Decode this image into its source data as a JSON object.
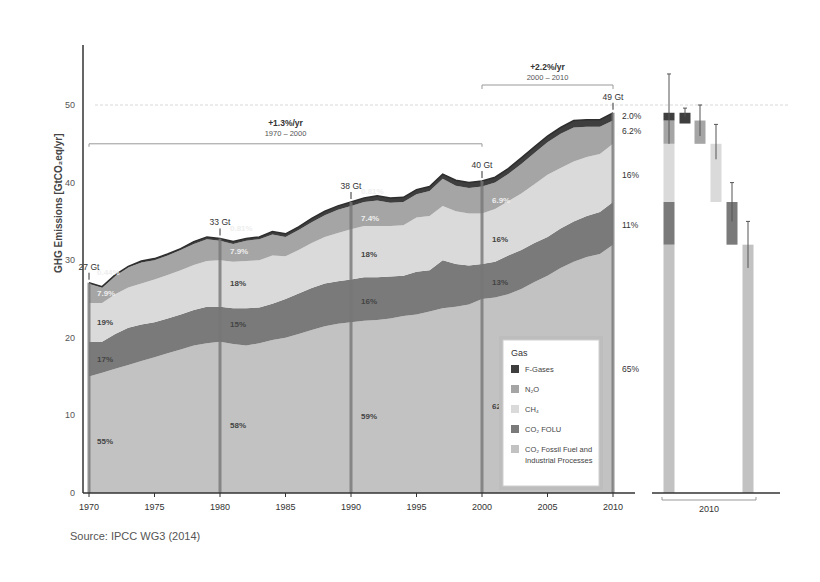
{
  "chart_data": {
    "type": "area",
    "title": "",
    "ylabel": "GHG Emissions [GtCO2eq/yr]",
    "xlabel": "",
    "ylim": [
      0,
      50
    ],
    "yticks": [
      0,
      10,
      20,
      30,
      40,
      50
    ],
    "xticks": [
      1970,
      1975,
      1980,
      1985,
      1990,
      1995,
      2000,
      2005,
      2010
    ],
    "x": [
      1970,
      1971,
      1972,
      1973,
      1974,
      1975,
      1976,
      1977,
      1978,
      1979,
      1980,
      1981,
      1982,
      1983,
      1984,
      1985,
      1986,
      1987,
      1988,
      1989,
      1990,
      1991,
      1992,
      1993,
      1994,
      1995,
      1996,
      1997,
      1998,
      1999,
      2000,
      2001,
      2002,
      2003,
      2004,
      2005,
      2006,
      2007,
      2008,
      2009,
      2010
    ],
    "series": [
      {
        "name": "CO2 Fossil Fuel and Industrial Processes",
        "color": "#c2c2c2",
        "values": [
          15,
          15.5,
          16,
          16.5,
          17,
          17.5,
          18,
          18.5,
          19,
          19.3,
          19.5,
          19.2,
          19,
          19.3,
          19.7,
          20,
          20.5,
          21,
          21.5,
          21.8,
          22,
          22.2,
          22.3,
          22.5,
          22.8,
          23,
          23.4,
          23.8,
          24,
          24.3,
          25,
          25.2,
          25.6,
          26.3,
          27.2,
          28,
          29,
          29.8,
          30.4,
          30.8,
          32
        ]
      },
      {
        "name": "CO2 FOLU",
        "color": "#7a7a7a",
        "values": [
          4.5,
          4,
          4.5,
          4.8,
          4.7,
          4.5,
          4.5,
          4.5,
          4.6,
          4.7,
          4.5,
          4.6,
          4.8,
          4.6,
          4.7,
          5,
          5.2,
          5.4,
          5.5,
          5.5,
          5.5,
          5.6,
          5.5,
          5.4,
          5.2,
          5.5,
          5.3,
          6.2,
          5.5,
          5,
          4.5,
          4.6,
          5,
          5,
          5,
          5,
          5.1,
          5.2,
          5.3,
          5.4,
          5.5
        ]
      },
      {
        "name": "CH4",
        "color": "#dadada",
        "values": [
          5,
          5,
          5.1,
          5.2,
          5.3,
          5.5,
          5.6,
          5.7,
          5.8,
          5.9,
          6,
          6,
          6.1,
          6.1,
          6.2,
          5.5,
          5.6,
          5.8,
          6,
          6.2,
          6.5,
          6.6,
          6.6,
          6.5,
          6.5,
          7,
          7,
          7,
          6.8,
          6.7,
          6.5,
          6.8,
          7,
          7.3,
          7.6,
          8,
          7.8,
          7.7,
          7.6,
          7.5,
          7.5
        ]
      },
      {
        "name": "N2O",
        "color": "#a5a5a5",
        "values": [
          2.5,
          2,
          2.4,
          2.6,
          2.7,
          2.5,
          2.5,
          2.6,
          2.7,
          2.8,
          2.5,
          2.3,
          2.6,
          2.7,
          2.7,
          2.5,
          2.6,
          2.7,
          2.8,
          3,
          3,
          3.1,
          3.3,
          3,
          3,
          3,
          3.2,
          3.5,
          3.3,
          3.3,
          3.5,
          3.4,
          3.5,
          3.8,
          4,
          4.2,
          4.4,
          4.4,
          3.9,
          3.5,
          3
        ]
      },
      {
        "name": "F-Gases",
        "color": "#3e3e3e",
        "values": [
          0.1,
          0.1,
          0.1,
          0.1,
          0.2,
          0.2,
          0.2,
          0.2,
          0.3,
          0.3,
          0.3,
          0.3,
          0.3,
          0.3,
          0.4,
          0.4,
          0.4,
          0.5,
          0.5,
          0.5,
          0.5,
          0.5,
          0.6,
          0.6,
          0.6,
          0.6,
          0.6,
          0.6,
          0.7,
          0.7,
          0.7,
          0.7,
          0.7,
          0.8,
          0.8,
          0.8,
          0.8,
          0.9,
          0.9,
          0.9,
          1.0
        ]
      }
    ],
    "totals_markers": [
      {
        "year": 1970,
        "label": "27 Gt"
      },
      {
        "year": 1980,
        "label": "33 Gt"
      },
      {
        "year": 1990,
        "label": "38 Gt"
      },
      {
        "year": 2000,
        "label": "40 Gt"
      },
      {
        "year": 2010,
        "label": "49 Gt"
      }
    ],
    "share_labels": [
      {
        "year": 1970,
        "co2_ff": "55%",
        "co2_folu": "17%",
        "ch4": "19%",
        "n2o": "7.9%",
        "fgases": "0.44%"
      },
      {
        "year": 1980,
        "co2_ff": "58%",
        "co2_folu": "15%",
        "ch4": "18%",
        "n2o": "7.9%",
        "fgases": "0.81%"
      },
      {
        "year": 1990,
        "co2_ff": "59%",
        "co2_folu": "16%",
        "ch4": "18%",
        "n2o": "7.4%",
        "fgases": "0.81%"
      },
      {
        "year": 2000,
        "co2_ff": "62%",
        "co2_folu": "13%",
        "ch4": "16%",
        "n2o": "6.9%",
        "fgases": "1.3%"
      },
      {
        "year": 2010,
        "co2_ff": "65%",
        "co2_folu": "11%",
        "ch4": "16%",
        "n2o": "6.2%",
        "fgases": "2.0%"
      }
    ],
    "growth_annotations": [
      {
        "rate": "+1.3%/yr",
        "period": "1970 – 2000"
      },
      {
        "rate": "+2.2%/yr",
        "period": "2000 – 2010"
      }
    ],
    "uncertainty_2010": {
      "xlabel": "2010",
      "bars": [
        {
          "name": "Total",
          "value": 49,
          "low": 45,
          "high": 54
        },
        {
          "name": "F-Gases",
          "value": 1.0,
          "low": 0.8,
          "high": 1.2
        },
        {
          "name": "N2O",
          "value": 3.0,
          "low": 1.8,
          "high": 4.2
        },
        {
          "name": "CH4",
          "value": 7.5,
          "low": 6.0,
          "high": 9.0
        },
        {
          "name": "CO2 FOLU",
          "value": 5.5,
          "low": 3.5,
          "high": 7.5
        },
        {
          "name": "CO2 Fossil Fuel and Industrial Processes",
          "value": 32,
          "low": 29,
          "high": 35
        }
      ]
    },
    "legend": {
      "title": "Gas",
      "position": "inside-lower-right",
      "entries": [
        "F-Gases",
        "N2O",
        "CH4",
        "CO2 FOLU",
        "CO2 Fossil Fuel and Industrial Processes"
      ]
    },
    "grid": false
  },
  "labels": {
    "ylabel": "GHG Emissions [GtCO₂eq/yr]",
    "growth1_rate": "+1.3%/yr",
    "growth1_period": "1970 – 2000",
    "growth2_rate": "+2.2%/yr",
    "growth2_period": "2000 – 2010",
    "right_shares": [
      "2.0%",
      "6.2%",
      "16%",
      "11%",
      "65%"
    ],
    "bar_xlabel": "2010",
    "source": "Source: IPCC WG3 (2014)"
  },
  "legend": {
    "title": "Gas",
    "items": [
      {
        "label": "F-Gases",
        "color": "#3e3e3e"
      },
      {
        "label": "N₂O",
        "color": "#a5a5a5"
      },
      {
        "label": "CH₄",
        "color": "#dadada"
      },
      {
        "label": "CO₂ FOLU",
        "color": "#7a7a7a"
      },
      {
        "label": "CO₂ Fossil Fuel and",
        "label2": "Industrial Processes",
        "color": "#c2c2c2"
      }
    ]
  }
}
